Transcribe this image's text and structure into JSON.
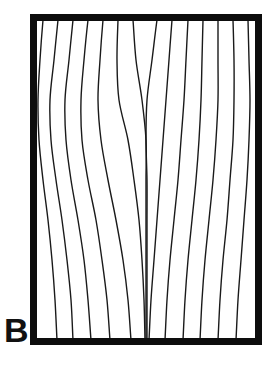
{
  "figure": {
    "panel_label": "B",
    "caption_text": "",
    "background_color": "#ffffff",
    "ink_color": "#111111"
  },
  "frame": {
    "name": "panel-border-rectangle",
    "x": 30,
    "y": 14,
    "width": 232,
    "height": 331,
    "border_thickness": 7,
    "border_color": "#0d0d0d",
    "fill_color": "#ffffff"
  },
  "chart_data": {
    "type": "line",
    "title": "",
    "subtitle": "",
    "xlabel": "",
    "ylabel": "",
    "xlim": [
      30,
      262
    ],
    "ylim": [
      14,
      345
    ],
    "grid": false,
    "legend": "none",
    "annotations": [
      {
        "name": "convergence-point",
        "label": "",
        "x": 146,
        "y": 131
      }
    ],
    "line_color": "#1a1a1a",
    "line_width": 1.4,
    "series": [
      {
        "name": "line-1",
        "points_x": [
          43,
          40,
          38,
          39,
          43,
          48,
          52,
          55,
          57
        ],
        "points_y": [
          20,
          60,
          100,
          140,
          180,
          220,
          260,
          300,
          340
        ]
      },
      {
        "name": "line-2",
        "points_x": [
          58,
          54,
          50,
          51,
          56,
          62,
          67,
          71,
          73
        ],
        "points_y": [
          20,
          60,
          100,
          140,
          180,
          220,
          260,
          300,
          340
        ]
      },
      {
        "name": "line-3",
        "points_x": [
          73,
          69,
          65,
          66,
          71,
          78,
          84,
          88,
          91
        ],
        "points_y": [
          20,
          60,
          100,
          140,
          180,
          220,
          260,
          300,
          340
        ]
      },
      {
        "name": "line-4",
        "points_x": [
          88,
          84,
          81,
          82,
          88,
          96,
          102,
          107,
          110
        ],
        "points_y": [
          20,
          60,
          100,
          140,
          180,
          220,
          260,
          300,
          340
        ]
      },
      {
        "name": "line-5",
        "points_x": [
          103,
          100,
          98,
          101,
          108,
          116,
          123,
          128,
          131
        ],
        "points_y": [
          20,
          60,
          100,
          140,
          180,
          220,
          260,
          300,
          340
        ]
      },
      {
        "name": "line-6",
        "points_x": [
          118,
          117,
          119,
          128,
          134,
          139,
          142,
          144,
          145
        ],
        "points_y": [
          20,
          60,
          100,
          140,
          180,
          220,
          260,
          300,
          340
        ]
      },
      {
        "name": "line-7",
        "points_x": [
          133,
          136,
          142,
          146,
          146,
          146,
          146,
          146,
          146
        ],
        "points_y": [
          20,
          60,
          100,
          140,
          180,
          220,
          260,
          300,
          340
        ]
      },
      {
        "name": "line-8",
        "points_x": [
          157,
          152,
          147,
          146,
          147,
          147,
          147,
          147,
          147
        ],
        "points_y": [
          20,
          60,
          100,
          140,
          180,
          220,
          260,
          300,
          340
        ]
      },
      {
        "name": "line-9",
        "points_x": [
          172,
          169,
          166,
          163,
          160,
          157,
          154,
          151,
          149
        ],
        "points_y": [
          20,
          60,
          100,
          140,
          180,
          220,
          260,
          300,
          340
        ]
      },
      {
        "name": "line-10",
        "points_x": [
          188,
          186,
          184,
          181,
          178,
          174,
          170,
          167,
          165
        ],
        "points_y": [
          20,
          60,
          100,
          140,
          180,
          220,
          260,
          300,
          340
        ]
      },
      {
        "name": "line-11",
        "points_x": [
          203,
          202,
          201,
          199,
          196,
          192,
          188,
          185,
          183
        ],
        "points_y": [
          20,
          60,
          100,
          140,
          180,
          220,
          260,
          300,
          340
        ]
      },
      {
        "name": "line-12",
        "points_x": [
          218,
          218,
          218,
          216,
          213,
          209,
          205,
          202,
          200
        ],
        "points_y": [
          20,
          60,
          100,
          140,
          180,
          220,
          260,
          300,
          340
        ]
      },
      {
        "name": "line-13",
        "points_x": [
          233,
          234,
          234,
          233,
          230,
          227,
          223,
          220,
          218
        ],
        "points_y": [
          20,
          60,
          100,
          140,
          180,
          220,
          260,
          300,
          340
        ]
      },
      {
        "name": "line-14",
        "points_x": [
          248,
          249,
          250,
          249,
          247,
          244,
          241,
          238,
          236
        ],
        "points_y": [
          20,
          60,
          100,
          140,
          180,
          220,
          260,
          300,
          340
        ]
      }
    ]
  }
}
